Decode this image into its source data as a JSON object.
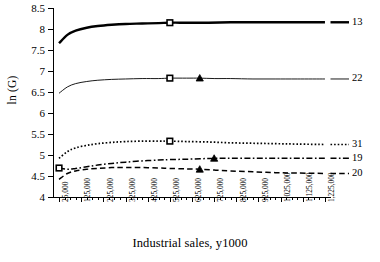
{
  "chart_data": {
    "type": "line",
    "title": "",
    "xlabel": "Industrial sales, y1000",
    "ylabel": "ln (G)",
    "xlim": [
      0,
      1250000
    ],
    "ylim": [
      4,
      8.5
    ],
    "grid": false,
    "legend_position": "right-of-plot-end-labels",
    "ytick_labels": [
      "8.5",
      "8",
      "7.5",
      "7",
      "6.5",
      "6",
      "5.5",
      "5",
      "4.5",
      "4"
    ],
    "ytick_values": [
      8.5,
      8,
      7.5,
      7,
      6.5,
      6,
      5.5,
      5,
      4.5,
      4
    ],
    "xtick_labels": [
      "25,000",
      "125,000",
      "225,000",
      "325,000",
      "425,000",
      "525,000",
      "625,000",
      "725,000",
      "825,000",
      "925,000",
      "1,025,000",
      "1,125,000",
      "1,225,000"
    ],
    "xtick_values": [
      25000,
      125000,
      225000,
      325000,
      425000,
      525000,
      625000,
      725000,
      825000,
      925000,
      1025000,
      1125000,
      1225000
    ],
    "x_minor_step": 25000,
    "series": [
      {
        "name": "13",
        "label": "13",
        "style": "solid-thick",
        "marker": "square",
        "x": [
          25000,
          62500,
          100000,
          150000,
          200000,
          262500,
          325000,
          400000,
          475000,
          525000,
          600000,
          700000,
          800000,
          900000,
          1000000,
          1100000,
          1225000
        ],
        "values": [
          7.66,
          7.86,
          7.96,
          8.03,
          8.07,
          8.1,
          8.12,
          8.13,
          8.14,
          8.15,
          8.15,
          8.15,
          8.16,
          8.16,
          8.16,
          8.16,
          8.16
        ],
        "marker_points": [
          {
            "x": 525000,
            "y": 8.15
          }
        ]
      },
      {
        "name": "22",
        "label": "22",
        "style": "solid-thin",
        "marker": "square-and-triangle",
        "x": [
          25000,
          62500,
          100000,
          150000,
          200000,
          262500,
          325000,
          400000,
          475000,
          525000,
          600000,
          660000,
          725000,
          800000,
          900000,
          1000000,
          1100000,
          1225000
        ],
        "values": [
          6.47,
          6.62,
          6.7,
          6.75,
          6.78,
          6.8,
          6.81,
          6.82,
          6.82,
          6.83,
          6.83,
          6.83,
          6.82,
          6.82,
          6.81,
          6.81,
          6.81,
          6.81
        ],
        "marker_points": [
          {
            "x": 525000,
            "y": 6.83
          },
          {
            "x": 660000,
            "y": 6.83
          }
        ]
      },
      {
        "name": "31",
        "label": "31",
        "style": "dotted",
        "marker": "square",
        "x": [
          25000,
          62500,
          100000,
          150000,
          200000,
          262500,
          325000,
          400000,
          475000,
          525000,
          600000,
          700000,
          800000,
          900000,
          1000000,
          1100000,
          1225000
        ],
        "values": [
          4.92,
          5.08,
          5.17,
          5.23,
          5.27,
          5.3,
          5.32,
          5.33,
          5.33,
          5.33,
          5.32,
          5.31,
          5.29,
          5.28,
          5.27,
          5.26,
          5.25
        ],
        "marker_points": [
          {
            "x": 525000,
            "y": 5.33
          }
        ]
      },
      {
        "name": "19",
        "label": "19",
        "style": "dash-dot",
        "marker": "square-and-triangle",
        "x": [
          25000,
          62500,
          100000,
          150000,
          200000,
          262500,
          325000,
          400000,
          475000,
          525000,
          600000,
          725000,
          800000,
          900000,
          1000000,
          1100000,
          1225000
        ],
        "values": [
          4.69,
          4.66,
          4.68,
          4.72,
          4.76,
          4.8,
          4.83,
          4.86,
          4.88,
          4.89,
          4.9,
          4.92,
          4.92,
          4.92,
          4.92,
          4.92,
          4.92
        ],
        "marker_points": [
          {
            "x": 25000,
            "y": 4.69
          },
          {
            "x": 725000,
            "y": 4.92
          }
        ]
      },
      {
        "name": "20",
        "label": "20",
        "style": "dashed",
        "marker": "triangle",
        "x": [
          25000,
          62500,
          100000,
          150000,
          200000,
          262500,
          325000,
          400000,
          475000,
          525000,
          600000,
          660000,
          725000,
          800000,
          900000,
          1000000,
          1100000,
          1225000
        ],
        "values": [
          4.42,
          4.56,
          4.62,
          4.66,
          4.68,
          4.7,
          4.7,
          4.7,
          4.69,
          4.68,
          4.67,
          4.66,
          4.64,
          4.62,
          4.6,
          4.58,
          4.57,
          4.56
        ],
        "marker_points": [
          {
            "x": 660000,
            "y": 4.66
          }
        ]
      }
    ]
  },
  "axes": {
    "ylabel": "ln (G)",
    "xlabel": "Industrial sales, y1000"
  }
}
